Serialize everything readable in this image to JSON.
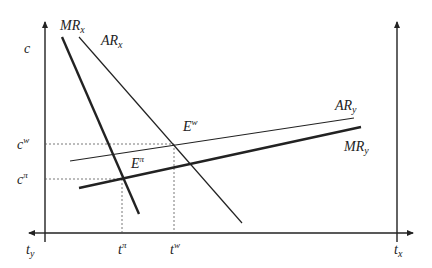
{
  "diagram": {
    "type": "economics-diagram",
    "axes": {
      "left_vertical": {
        "label": "c"
      },
      "horizontal_left_end": {
        "label": "t",
        "subscript": "y"
      },
      "horizontal_right_end": {
        "label": "t",
        "subscript": "x"
      }
    },
    "curves": [
      {
        "id": "MRx",
        "label": "MR",
        "subscript": "x",
        "weight": "thick"
      },
      {
        "id": "ARx",
        "label": "AR",
        "subscript": "x",
        "weight": "thin"
      },
      {
        "id": "ARy",
        "label": "AR",
        "subscript": "y",
        "weight": "thin"
      },
      {
        "id": "MRy",
        "label": "MR",
        "subscript": "y",
        "weight": "thick"
      }
    ],
    "points": [
      {
        "id": "Ew",
        "label": "E",
        "superscript": "w"
      },
      {
        "id": "Epi",
        "label": "E",
        "superscript": "π"
      }
    ],
    "y_ticks": [
      {
        "label": "c",
        "superscript": "w"
      },
      {
        "label": "c",
        "superscript": "π"
      }
    ],
    "x_ticks": [
      {
        "label": "t",
        "superscript": "π"
      },
      {
        "label": "t",
        "superscript": "w"
      }
    ]
  }
}
